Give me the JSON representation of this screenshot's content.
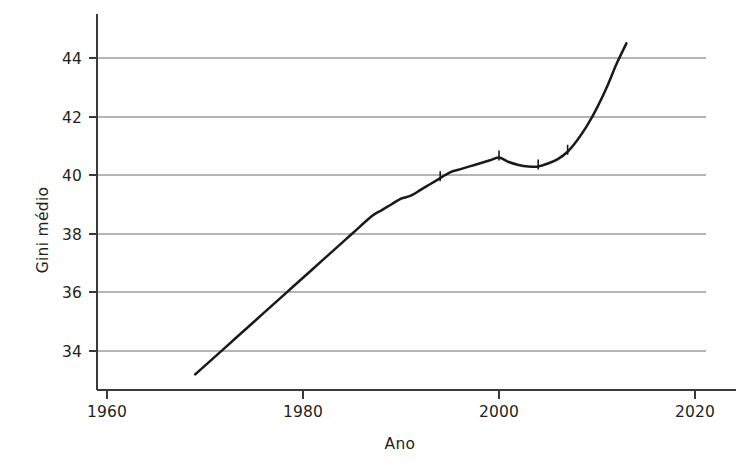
{
  "chart_data": {
    "type": "line",
    "title": "",
    "subtitle": "",
    "xlabel": "Ano",
    "ylabel": "Gini médio",
    "xlim": [
      1957,
      2023
    ],
    "ylim": [
      32.6,
      45.2
    ],
    "xticks": [
      1960,
      1980,
      2000,
      2020
    ],
    "xticklabels": [
      "1960",
      "1980",
      "2000",
      "2020"
    ],
    "yticks": [
      34,
      36,
      38,
      40,
      42,
      44
    ],
    "yticklabels": [
      "34",
      "36",
      "38",
      "40",
      "42",
      "44"
    ],
    "grid": "horizontal",
    "legend": "none",
    "series": [
      {
        "name": "Gini médio",
        "color": "#1a1a1a",
        "x": [
          1969,
          1971,
          1973,
          1975,
          1977,
          1979,
          1981,
          1983,
          1985,
          1987,
          1988,
          1989,
          1990,
          1991,
          1992,
          1993,
          1994,
          1995,
          1996,
          1997,
          1998,
          1999,
          2000,
          2001,
          2002,
          2003,
          2004,
          2005,
          2006,
          2007,
          2008,
          2009,
          2010,
          2011,
          2012,
          2013
        ],
        "values": [
          33.2,
          33.8,
          34.4,
          35.0,
          35.6,
          36.2,
          36.8,
          37.4,
          38.0,
          38.6,
          38.8,
          39.0,
          39.2,
          39.3,
          39.5,
          39.7,
          39.9,
          40.1,
          40.2,
          40.3,
          40.4,
          40.5,
          40.6,
          40.45,
          40.35,
          40.3,
          40.3,
          40.4,
          40.55,
          40.8,
          41.2,
          41.7,
          42.3,
          43.0,
          43.8,
          44.5
        ]
      }
    ],
    "annotations": [
      {
        "kind": "data-spike",
        "x": 1994,
        "note": "small vertical tick on curve"
      },
      {
        "kind": "data-spike",
        "x": 2000,
        "note": "small vertical tick on curve"
      },
      {
        "kind": "data-spike",
        "x": 2004,
        "note": "small vertical tick on curve"
      },
      {
        "kind": "data-spike",
        "x": 2007,
        "note": "small vertical tick on curve"
      }
    ]
  },
  "axes": {
    "y_title": "Gini médio",
    "x_title": "Ano",
    "x_tick_labels": [
      "1960",
      "1980",
      "2000",
      "2020"
    ],
    "y_tick_labels": [
      "34",
      "36",
      "38",
      "40",
      "42",
      "44"
    ]
  },
  "colors": {
    "line": "#1a1a1a",
    "grid": "#b5b5b5",
    "axis": "#3a3a3a",
    "text": "#231f20",
    "background": "#ffffff"
  }
}
